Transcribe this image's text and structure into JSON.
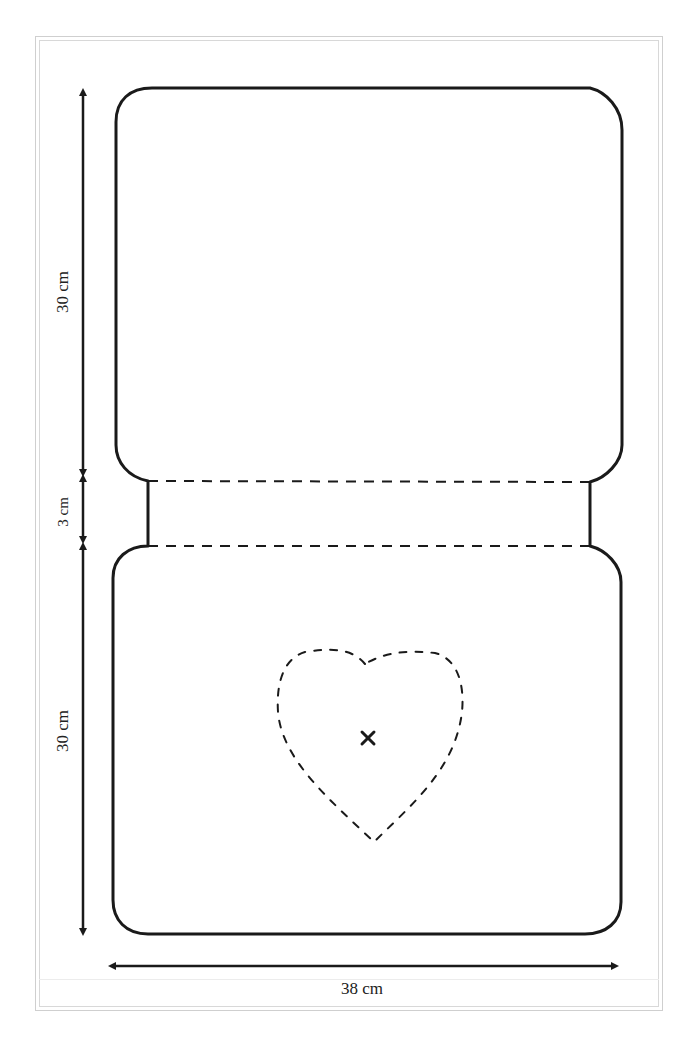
{
  "diagram": {
    "type": "sewing-pattern",
    "colors": {
      "outline": "#1a1a1a",
      "frame": "#cfcfcf",
      "background": "#ffffff"
    },
    "dimensions": {
      "top_panel_height": "30 cm",
      "spine_height": "3 cm",
      "bottom_panel_height": "30 cm",
      "total_width": "38 cm"
    },
    "elements": {
      "top_panel": {
        "label": "top panel",
        "shape": "rounded rectangle"
      },
      "spine": {
        "label": "fold strip",
        "fold_lines": "dashed"
      },
      "bottom_panel": {
        "label": "bottom panel",
        "shape": "rounded rectangle"
      },
      "heart": {
        "label": "heart stitch outline",
        "line_style": "dashed"
      },
      "center_mark": {
        "glyph": "×"
      }
    }
  }
}
